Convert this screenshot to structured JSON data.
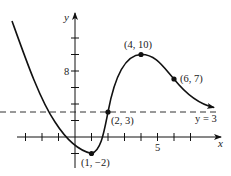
{
  "chart_data": {
    "type": "line",
    "title": "",
    "xlabel": "x",
    "ylabel": "y",
    "x_ticks": [
      -3,
      -2,
      -1,
      1,
      2,
      3,
      4,
      5,
      6,
      7
    ],
    "x_tick_labels": [
      {
        "value": 5,
        "label": "5"
      }
    ],
    "y_ticks": [
      -2,
      2,
      4,
      6,
      8,
      10,
      12
    ],
    "y_tick_labels": [
      {
        "value": 8,
        "label": "8"
      }
    ],
    "xlim": [
      -3.5,
      8.8
    ],
    "ylim": [
      -3.5,
      15
    ],
    "grid": false,
    "asymptote": {
      "type": "horizontal",
      "y": 3,
      "label": "y = 3",
      "style": "dashed"
    },
    "points": [
      {
        "x": 1,
        "y": -2,
        "label": "(1, −2)"
      },
      {
        "x": 2,
        "y": 3,
        "label": "(2, 3)"
      },
      {
        "x": 4,
        "y": 10,
        "label": "(4, 10)"
      },
      {
        "x": 6,
        "y": 7,
        "label": "(6, 7)"
      }
    ],
    "curve": {
      "description": "Decreasing from upper left to local minimum (1,-2), increasing through (2,3) to local maximum (4,10), decreasing through (6,7) and approaching horizontal asymptote y=3 from above as x→∞",
      "x": [
        -3.8,
        -2,
        -1,
        0,
        1,
        2,
        3,
        4,
        5,
        6,
        7,
        8.3
      ],
      "y": [
        14,
        7.5,
        3.5,
        0.2,
        -2,
        3,
        8.5,
        10,
        9,
        7,
        4.8,
        3.5
      ]
    },
    "arrows": {
      "x_axis": true,
      "y_axis": true,
      "curve_right_end": true
    }
  },
  "labels": {
    "x_axis": "x",
    "y_axis": "y",
    "tick_5": "5",
    "tick_8": "8",
    "asymptote": "y = 3",
    "p1": "(1, −2)",
    "p2": "(2, 3)",
    "p3": "(4, 10)",
    "p4": "(6, 7)"
  }
}
